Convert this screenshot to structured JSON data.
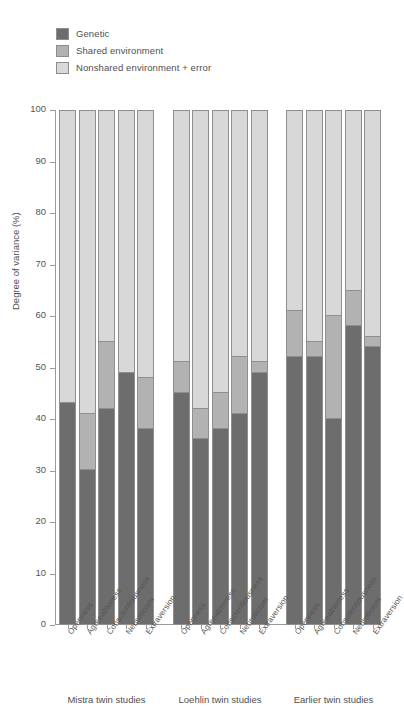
{
  "chart_data": {
    "type": "bar",
    "subtype": "stacked-bar-grouped",
    "title": "",
    "xlabel": "",
    "ylabel": "Degree of variance (%)",
    "ylim": [
      0,
      100
    ],
    "ytick_labels": [
      "0",
      "10",
      "20",
      "30",
      "40",
      "50",
      "60",
      "70",
      "80",
      "90",
      "100"
    ],
    "ytick_values": [
      0,
      10,
      20,
      30,
      40,
      50,
      60,
      70,
      80,
      90,
      100
    ],
    "grid": false,
    "legend_position": "top-left",
    "stack_order": [
      "Genetic",
      "Shared environment",
      "Nonshared environment + error"
    ],
    "legend": [
      {
        "label": "Genetic",
        "color": "#6d6d6d"
      },
      {
        "label": "Shared environment",
        "color": "#b2b2b2"
      },
      {
        "label": "Nonshared environment + error",
        "color": "#d8d8d8"
      }
    ],
    "categories": [
      "Openness",
      "Agreeableness",
      "Conscientiousness",
      "Neuroticism",
      "Extraversion"
    ],
    "groups": [
      {
        "name": "Mistra twin studies",
        "bars": [
          {
            "category": "Openness",
            "genetic": 43,
            "shared": 0,
            "nonshared": 57
          },
          {
            "category": "Agreeableness",
            "genetic": 30,
            "shared": 11,
            "nonshared": 59
          },
          {
            "category": "Conscientiousness",
            "genetic": 42,
            "shared": 13,
            "nonshared": 45
          },
          {
            "category": "Neuroticism",
            "genetic": 49,
            "shared": 0,
            "nonshared": 51
          },
          {
            "category": "Extraversion",
            "genetic": 38,
            "shared": 10,
            "nonshared": 52
          }
        ]
      },
      {
        "name": "Loehlin twin studies",
        "bars": [
          {
            "category": "Openness",
            "genetic": 45,
            "shared": 6,
            "nonshared": 49
          },
          {
            "category": "Agreeableness",
            "genetic": 36,
            "shared": 6,
            "nonshared": 58
          },
          {
            "category": "Conscientiousness",
            "genetic": 38,
            "shared": 7,
            "nonshared": 55
          },
          {
            "category": "Neuroticism",
            "genetic": 41,
            "shared": 11,
            "nonshared": 48
          },
          {
            "category": "Extraversion",
            "genetic": 49,
            "shared": 2,
            "nonshared": 49
          }
        ]
      },
      {
        "name": "Earlier twin studies",
        "bars": [
          {
            "category": "Openness",
            "genetic": 52,
            "shared": 9,
            "nonshared": 39
          },
          {
            "category": "Agreeableness",
            "genetic": 52,
            "shared": 3,
            "nonshared": 45
          },
          {
            "category": "Conscientiousness",
            "genetic": 40,
            "shared": 20,
            "nonshared": 40
          },
          {
            "category": "Neuroticism",
            "genetic": 58,
            "shared": 7,
            "nonshared": 35
          },
          {
            "category": "Extraversion",
            "genetic": 54,
            "shared": 2,
            "nonshared": 44
          }
        ]
      }
    ]
  }
}
